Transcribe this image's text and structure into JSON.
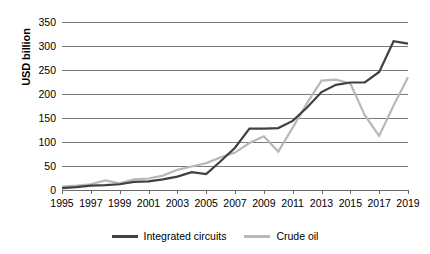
{
  "chart_data": {
    "type": "line",
    "title": "",
    "xlabel": "",
    "ylabel": "USD billion",
    "ylim": [
      0,
      350
    ],
    "ytick_step": 50,
    "yticks": [
      "0",
      "50",
      "100",
      "150",
      "200",
      "250",
      "300",
      "350"
    ],
    "grid": true,
    "legend_position": "bottom",
    "x": [
      1995,
      1996,
      1997,
      1998,
      1999,
      2000,
      2001,
      2002,
      2003,
      2004,
      2005,
      2006,
      2007,
      2008,
      2009,
      2010,
      2011,
      2012,
      2013,
      2014,
      2015,
      2016,
      2017,
      2018,
      2019
    ],
    "xtick_labels": [
      "1995",
      "1997",
      "1999",
      "2001",
      "2003",
      "2005",
      "2007",
      "2009",
      "2011",
      "2013",
      "2015",
      "2017",
      "2019"
    ],
    "series": [
      {
        "name": "Integrated circuits",
        "color": "#404040",
        "values": [
          4,
          6,
          9,
          10,
          12,
          17,
          18,
          22,
          28,
          37,
          33,
          60,
          88,
          128,
          128,
          129,
          144,
          172,
          204,
          219,
          224,
          224,
          246,
          310,
          305
        ]
      },
      {
        "name": "Crude oil",
        "color": "#b8b8b8",
        "values": [
          7,
          9,
          12,
          20,
          14,
          22,
          24,
          30,
          42,
          49,
          56,
          68,
          78,
          98,
          112,
          80,
          130,
          181,
          228,
          230,
          222,
          156,
          113,
          176,
          235
        ]
      }
    ]
  },
  "legend": {
    "items": [
      {
        "label": "Integrated circuits",
        "color": "#404040",
        "swatch": "line-swatch"
      },
      {
        "label": "Crude oil",
        "color": "#b8b8b8",
        "swatch": "line-swatch"
      }
    ]
  },
  "axis": {
    "y_title": "USD billion"
  }
}
